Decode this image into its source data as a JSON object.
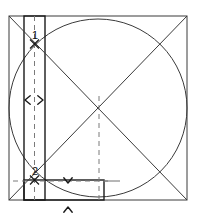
{
  "figure": {
    "canvas": {
      "width": 198,
      "height": 222,
      "background": "#ffffff"
    }
  },
  "colors": {
    "stroke_dark": "#1a1a1a",
    "stroke_thin": "#3a3a3a",
    "stroke_light": "#6e6e6e",
    "dashed": "#7a7a7a",
    "text": "#111111",
    "background": "#ffffff"
  },
  "chart_data": {
    "type": "diagram",
    "xlabel": "",
    "ylabel": "",
    "shapes": [
      {
        "name": "outer-square",
        "kind": "rect",
        "x": 9,
        "y": 16,
        "width": 178,
        "height": 184,
        "stroke": "#3a3a3a",
        "stroke_width": 1,
        "fill": "none"
      },
      {
        "name": "inscribed-circle",
        "kind": "circle",
        "cx": 98,
        "cy": 108,
        "r": 89,
        "stroke": "#3a3a3a",
        "stroke_width": 1,
        "fill": "none"
      },
      {
        "name": "vertical-rectangle",
        "kind": "rect",
        "x": 24,
        "y": 16,
        "width": 21,
        "height": 184,
        "stroke": "#1a1a1a",
        "stroke_width": 1.4,
        "fill": "none"
      },
      {
        "name": "horizontal-rectangle",
        "kind": "rect",
        "x": 24,
        "y": 180,
        "width": 80,
        "height": 20,
        "stroke": "#1a1a1a",
        "stroke_width": 1.4,
        "fill": "none"
      }
    ],
    "lines": [
      {
        "name": "diagonal-top-left-to-bottom-right",
        "x1": 9,
        "y1": 16,
        "x2": 187,
        "y2": 200,
        "stroke": "#3a3a3a",
        "stroke_width": 1,
        "dash": "none"
      },
      {
        "name": "diagonal-top-right-to-bottom-left",
        "x1": 187,
        "y1": 16,
        "x2": 9,
        "y2": 200,
        "stroke": "#3a3a3a",
        "stroke_width": 1,
        "dash": "none"
      },
      {
        "name": "rectangle-centerline-dashed",
        "x1": 34.5,
        "y1": 16,
        "x2": 34.5,
        "y2": 200,
        "stroke": "#7a7a7a",
        "stroke_width": 1,
        "dash": "5,4"
      },
      {
        "name": "center-vertical-dashed",
        "x1": 99,
        "y1": 96,
        "x2": 99,
        "y2": 200,
        "stroke": "#7a7a7a",
        "stroke_width": 1,
        "dash": "5,4"
      },
      {
        "name": "horizontal-guide-dashed",
        "x1": 13,
        "y1": 181,
        "x2": 112,
        "y2": 181,
        "stroke": "#7a7a7a",
        "stroke_width": 1,
        "dash": "5,4"
      },
      {
        "name": "top-extension-line",
        "x1": 104,
        "y1": 181,
        "x2": 120,
        "y2": 181,
        "stroke": "#6e6e6e",
        "stroke_width": 1,
        "dash": "none"
      }
    ],
    "points": [
      {
        "name": "point-1",
        "label": "1",
        "x": 34.5,
        "y": 44,
        "label_x": 35,
        "label_y": 39
      },
      {
        "name": "point-2",
        "label": "2",
        "x": 34.5,
        "y": 180,
        "label_x": 35,
        "label_y": 175
      }
    ],
    "dimension_markers": [
      {
        "name": "width-arrow-left",
        "direction": "left",
        "x": 25,
        "y": 100
      },
      {
        "name": "width-arrow-right",
        "direction": "right",
        "x": 43,
        "y": 100
      },
      {
        "name": "height-arrow-down",
        "direction": "down",
        "x": 68,
        "y": 183
      },
      {
        "name": "height-arrow-up",
        "direction": "up",
        "x": 68,
        "y": 207
      }
    ]
  }
}
